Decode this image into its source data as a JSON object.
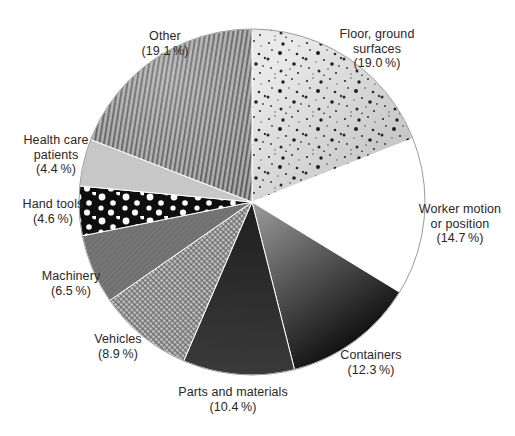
{
  "figure": {
    "colors": {
      "background": "#ffffff",
      "label_text": "#2a2627",
      "circle_outline": "#9a9a9a",
      "slice_separator": "#ffffff"
    }
  },
  "chart_data": {
    "type": "pie",
    "title": "",
    "start_angle_deg": 0,
    "direction": "clockwise-from-top",
    "geometry": {
      "cx": 252,
      "cy": 202,
      "r": 173
    },
    "legend_position": "around-pie-labels",
    "slices": [
      {
        "key": "floor-ground-surfaces",
        "label": "Floor, ground surfaces",
        "value": 19.0,
        "pct_text": "(19.0 %)",
        "texture": "light-speckled",
        "fill": "g-floor",
        "overlay": "p-floor-speckle"
      },
      {
        "key": "worker-motion-or-position",
        "label": "Worker motion or position",
        "value": 14.7,
        "pct_text": "(14.7 %)",
        "texture": "plain-white",
        "fill": "#ffffff"
      },
      {
        "key": "containers",
        "label": "Containers",
        "value": 12.3,
        "pct_text": "(12.3 %)",
        "texture": "gray-gradient",
        "fill": "g-containers"
      },
      {
        "key": "parts-and-materials",
        "label": "Parts and materials",
        "value": 10.4,
        "pct_text": "(10.4 %)",
        "texture": "near-black",
        "fill": "g-parts"
      },
      {
        "key": "vehicles",
        "label": "Vehicles",
        "value": 8.9,
        "pct_text": "(8.9 %)",
        "texture": "fine-weave",
        "fill": "p-vehicles"
      },
      {
        "key": "machinery",
        "label": "Machinery",
        "value": 6.5,
        "pct_text": "(6.5 %)",
        "texture": "medium-gray",
        "fill": "p-machinery"
      },
      {
        "key": "hand-tools",
        "label": "Hand tools",
        "value": 4.6,
        "pct_text": "(4.6 %)",
        "texture": "black-polka-dots",
        "fill": "p-handtools"
      },
      {
        "key": "health-care-patients",
        "label": "Health care patients",
        "value": 4.4,
        "pct_text": "(4.4 %)",
        "texture": "light-gray",
        "fill": "#c7c7c7"
      },
      {
        "key": "other",
        "label": "Other",
        "value": 19.1,
        "pct_text": "(19.1 %)",
        "texture": "vertical-ribbed",
        "fill": "p-other",
        "overlay": "g-other-sheen"
      }
    ]
  }
}
